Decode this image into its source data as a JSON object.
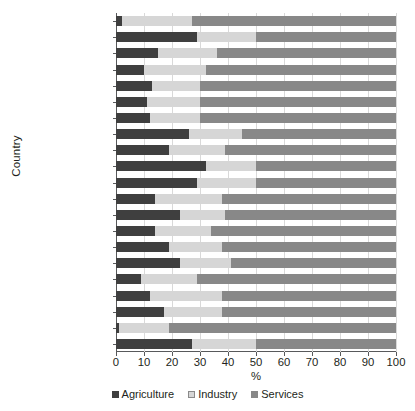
{
  "chart_data": {
    "type": "bar",
    "orientation": "horizontal",
    "stacked": true,
    "stack_total": 100,
    "title": "",
    "xlabel": "%",
    "ylabel": "Country",
    "xlim": [
      0,
      100
    ],
    "xticks": [
      0,
      10,
      20,
      30,
      40,
      50,
      60,
      70,
      80,
      90,
      100
    ],
    "xtick_labels": [
      "0",
      "10",
      "20",
      "30",
      "40",
      "50",
      "60",
      "70",
      "80",
      "90",
      "100"
    ],
    "grid": "vertical",
    "legend_position": "bottom",
    "legend": [
      "Agriculture",
      "Industry",
      "Services"
    ],
    "colors": {
      "agriculture": "#3f3f3f",
      "industry": "#d6d6d6",
      "services": "#888888",
      "axis": "#58595b",
      "grid": "#d9d9d9",
      "text": "#231f20",
      "background": "#ffffff"
    },
    "categories": [
      "Argentina",
      "Bolivia",
      "Brazil",
      "Chile",
      "Colombia",
      "Costa Rica",
      "Dominican Republic",
      "Ecuador",
      "El Salvador",
      "Guatemala",
      "Honduras",
      "Mexico",
      "Nicaragua",
      "Panama",
      "Paraguay",
      "Peru",
      "Uruguay",
      "Venezuela. RB",
      "Latin America",
      "U.S.",
      "China"
    ],
    "series": [
      {
        "name": "Agriculture",
        "key": "agriculture",
        "values": [
          2,
          29,
          15,
          10,
          13,
          11,
          12,
          26,
          19,
          32,
          29,
          14,
          23,
          14,
          19,
          23,
          9,
          12,
          17,
          1,
          27
        ]
      },
      {
        "name": "Industry",
        "key": "industry",
        "values": [
          25,
          21,
          21,
          22,
          17,
          19,
          18,
          19,
          20,
          18,
          21,
          24,
          16,
          20,
          19,
          18,
          20,
          26,
          21,
          18,
          23
        ]
      },
      {
        "name": "Services",
        "key": "services",
        "values": [
          73,
          50,
          64,
          68,
          70,
          70,
          70,
          55,
          61,
          50,
          50,
          62,
          61,
          66,
          62,
          59,
          71,
          62,
          62,
          81,
          50
        ]
      }
    ]
  }
}
